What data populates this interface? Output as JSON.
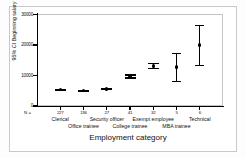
{
  "chart_data": {
    "type": "scatter",
    "title": "",
    "xlabel": "Employment category",
    "ylabel": "95% CI Beginning salary",
    "ylim": [
      0,
      30000
    ],
    "yticks": [
      0,
      10000,
      20000,
      30000
    ],
    "ytick_labels": [
      "0",
      "10000",
      "20000",
      "30000"
    ],
    "grid": false,
    "legend": null,
    "n_label": "N =",
    "categories": [
      "Clerical",
      "Office trainee",
      "Security officer",
      "College trainee",
      "Exempt employee",
      "MBA trainee",
      "Technical"
    ],
    "counts": [
      "227",
      "136",
      "27",
      "41",
      "32",
      "5",
      "6"
    ],
    "series": [
      {
        "name": "95% CI Beginning salary",
        "values": [
          5300,
          4950,
          5600,
          9700,
          13100,
          12800,
          20000
        ],
        "ci_lower": [
          5150,
          4850,
          5450,
          9200,
          12300,
          8100,
          13300
        ],
        "ci_upper": [
          5450,
          5100,
          5750,
          10150,
          13900,
          17100,
          26500
        ]
      }
    ]
  },
  "axis": {
    "y_title": "95% CI Beginning salary",
    "x_title": "Employment category"
  }
}
